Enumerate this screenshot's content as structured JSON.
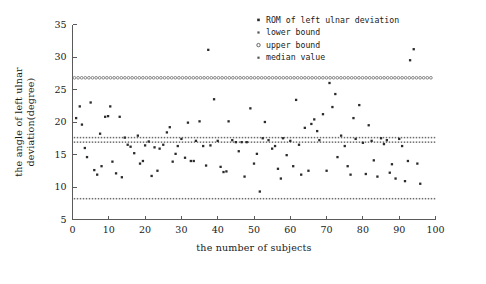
{
  "chart_data": {
    "type": "scatter",
    "title": "",
    "xlabel": "the number of subjects",
    "ylabel": "the angle of left ulnar deviation(degree)",
    "xlim": [
      0,
      100
    ],
    "ylim": [
      5,
      35
    ],
    "xticks": [
      0,
      10,
      20,
      30,
      40,
      50,
      60,
      70,
      80,
      90,
      100
    ],
    "yticks": [
      5,
      10,
      15,
      20,
      25,
      30,
      35
    ],
    "grid": false,
    "legend_position": "top-right",
    "legend": [
      {
        "label": "ROM of left ulnar deviation",
        "marker": "filled-dot"
      },
      {
        "label": "lower bound",
        "marker": "small-square"
      },
      {
        "label": "upper bound",
        "marker": "open-circle"
      },
      {
        "label": "median value",
        "marker": "small-square"
      }
    ],
    "reference_lines": [
      {
        "name": "upper bound",
        "value": 26.8,
        "marker": "open-circle"
      },
      {
        "name": "median value",
        "value": 17.6,
        "marker": "small-square"
      },
      {
        "name": "lower bound_upper_band",
        "value": 16.9,
        "marker": "small-square"
      },
      {
        "name": "lower bound",
        "value": 8.2,
        "marker": "small-square"
      }
    ],
    "series": [
      {
        "name": "ROM of left ulnar deviation",
        "points": [
          [
            1,
            20.6
          ],
          [
            2,
            22.4
          ],
          [
            2.6,
            19.6
          ],
          [
            3.4,
            16.0
          ],
          [
            4,
            14.6
          ],
          [
            5,
            23.0
          ],
          [
            6,
            12.6
          ],
          [
            6.8,
            11.9
          ],
          [
            7.6,
            18.2
          ],
          [
            8,
            13.2
          ],
          [
            9,
            20.8
          ],
          [
            9.8,
            20.9
          ],
          [
            10.4,
            22.4
          ],
          [
            11,
            13.9
          ],
          [
            12,
            12.1
          ],
          [
            13,
            20.8
          ],
          [
            13.6,
            11.5
          ],
          [
            14.4,
            17.6
          ],
          [
            15.2,
            16.5
          ],
          [
            16,
            16.2
          ],
          [
            17,
            15.2
          ],
          [
            18,
            17.9
          ],
          [
            18.6,
            13.6
          ],
          [
            19.4,
            14.0
          ],
          [
            20,
            16.4
          ],
          [
            21,
            17.0
          ],
          [
            21.8,
            11.7
          ],
          [
            22.6,
            16.1
          ],
          [
            23.4,
            12.5
          ],
          [
            24,
            15.9
          ],
          [
            25,
            16.5
          ],
          [
            26,
            18.4
          ],
          [
            26.8,
            19.2
          ],
          [
            27.6,
            13.9
          ],
          [
            28.4,
            15.1
          ],
          [
            29,
            16.3
          ],
          [
            30,
            17.4
          ],
          [
            31,
            14.5
          ],
          [
            31.8,
            19.9
          ],
          [
            32.6,
            14.0
          ],
          [
            33.4,
            14.0
          ],
          [
            34,
            17.1
          ],
          [
            35,
            20.1
          ],
          [
            36,
            16.3
          ],
          [
            36.8,
            13.3
          ],
          [
            37.4,
            31.1
          ],
          [
            38,
            16.4
          ],
          [
            39,
            23.5
          ],
          [
            40,
            17.1
          ],
          [
            40.8,
            13.1
          ],
          [
            41.6,
            12.3
          ],
          [
            42.4,
            12.4
          ],
          [
            43,
            20.1
          ],
          [
            44,
            17.2
          ],
          [
            45,
            16.9
          ],
          [
            45.8,
            15.5
          ],
          [
            46.6,
            16.9
          ],
          [
            47.4,
            11.6
          ],
          [
            48,
            16.9
          ],
          [
            49,
            22.1
          ],
          [
            50,
            13.6
          ],
          [
            50.8,
            15.1
          ],
          [
            51.6,
            9.3
          ],
          [
            52.4,
            17.5
          ],
          [
            53,
            20.0
          ],
          [
            54,
            17.2
          ],
          [
            55,
            15.9
          ],
          [
            55.8,
            16.3
          ],
          [
            56.6,
            12.8
          ],
          [
            57.4,
            11.3
          ],
          [
            58,
            17.5
          ],
          [
            59,
            14.9
          ],
          [
            60,
            17.1
          ],
          [
            60.8,
            13.2
          ],
          [
            61.6,
            23.4
          ],
          [
            62.4,
            16.5
          ],
          [
            63,
            11.9
          ],
          [
            64,
            19.1
          ],
          [
            65,
            12.5
          ],
          [
            65.8,
            19.7
          ],
          [
            66.6,
            20.4
          ],
          [
            67.4,
            18.6
          ],
          [
            68,
            17.2
          ],
          [
            69,
            21.2
          ],
          [
            70,
            12.5
          ],
          [
            70.8,
            26.0
          ],
          [
            71.6,
            22.3
          ],
          [
            72.4,
            24.3
          ],
          [
            73,
            14.6
          ],
          [
            74,
            17.9
          ],
          [
            75,
            16.3
          ],
          [
            75.8,
            13.2
          ],
          [
            76.6,
            11.9
          ],
          [
            77.4,
            20.6
          ],
          [
            78,
            17.4
          ],
          [
            79,
            22.6
          ],
          [
            80,
            16.8
          ],
          [
            80.8,
            12.0
          ],
          [
            81.6,
            19.5
          ],
          [
            82.4,
            17.1
          ],
          [
            83,
            14.1
          ],
          [
            84,
            11.6
          ],
          [
            85,
            17.5
          ],
          [
            85.8,
            16.6
          ],
          [
            86.6,
            17.2
          ],
          [
            87.4,
            12.2
          ],
          [
            88,
            13.5
          ],
          [
            89,
            11.3
          ],
          [
            90,
            17.4
          ],
          [
            90.8,
            16.3
          ],
          [
            91.6,
            10.9
          ],
          [
            92.4,
            14.0
          ],
          [
            93,
            29.5
          ],
          [
            94,
            31.2
          ],
          [
            95,
            13.6
          ],
          [
            95.8,
            10.5
          ]
        ]
      }
    ]
  }
}
